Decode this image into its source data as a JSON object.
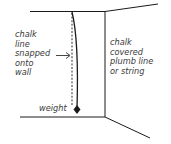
{
  "diagram": {
    "left_label": [
      "chalk",
      "line",
      "snapped",
      "onto",
      "wall"
    ],
    "right_label": [
      "chalk",
      "covered",
      "plumb line",
      "or string"
    ],
    "weight_label": "weight",
    "colors": {
      "line": "#1a1a1a",
      "text": "#3a3a3a",
      "background": "#ffffff"
    }
  }
}
